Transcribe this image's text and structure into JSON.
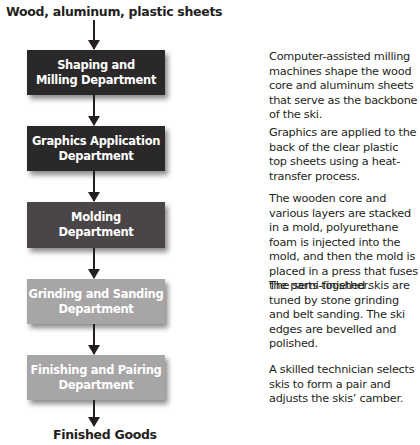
{
  "input_label": "Wood, aluminum, plastic sheets",
  "output_label": "Finished Goods",
  "colors": {
    "dark_box": "#2b2829",
    "medium_box": "#4a4647",
    "light_box": "#a7a5a5",
    "text": "#231f20"
  },
  "steps": [
    {
      "department": "Shaping and\nMilling Department",
      "description": "Computer-assisted milling machines shape the wood core and aluminum sheets that serve as the backbone of the ski."
    },
    {
      "department": "Graphics Application\nDepartment",
      "description": "Graphics are applied to the back of the clear plastic top sheets using a heat-transfer process."
    },
    {
      "department": "Molding\nDepartment",
      "description": "The wooden core and various layers are stacked in a mold, polyurethane foam is injected into the mold, and then the mold is placed in a press that fuses the parts together."
    },
    {
      "department": "Grinding and Sanding\nDepartment",
      "description": "The semi-finished skis are tuned by stone grinding and belt sanding. The ski edges are bevelled and polished."
    },
    {
      "department": "Finishing and Pairing\nDepartment",
      "description": "A skilled technician selects skis to form a pair and adjusts the skis’ camber."
    }
  ]
}
